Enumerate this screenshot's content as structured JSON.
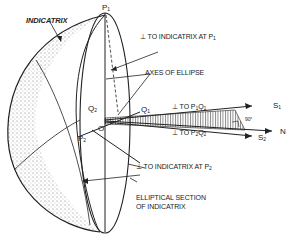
{
  "diagram": {
    "title_label": "INDICATRIX",
    "labels": {
      "normal_p1": "⊥ TO INDICATRIX AT P",
      "normal_p1_sub": "1",
      "axes": "AXES OF ELLIPSE",
      "perp_p1q1": "⊥ TO P",
      "perp_p1q1_sub1": "1",
      "perp_p1q1_mid": "Q",
      "perp_p1q1_sub2": "1",
      "perp_p2q2": "⊥ TO P",
      "perp_p2q2_sub1": "2",
      "perp_p2q2_mid": "Q",
      "perp_p2q2_sub2": "2",
      "normal_p2": "⊥ TO INDICATRIX AT P",
      "normal_p2_sub": "2",
      "elliptical_line1": "ELLIPTICAL SECTION",
      "elliptical_line2": "OF INDICATRIX",
      "angle": "90°"
    },
    "points": {
      "p1": "P",
      "p1_sub": "1",
      "p2": "P",
      "p2_sub": "2",
      "q1": "Q",
      "q1_sub": "1",
      "q2": "Q",
      "q2_sub": "2",
      "o": "O",
      "s1": "S",
      "s1_sub": "1",
      "s2": "S",
      "s2_sub": "2",
      "n": "N"
    },
    "colors": {
      "ink": "#222222",
      "paper": "#ffffff"
    }
  }
}
